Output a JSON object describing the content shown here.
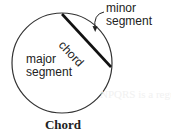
{
  "diagram": {
    "caption": "Chord",
    "labels": {
      "minor_line1": "minor",
      "minor_line2": "segment",
      "major_line1": "major",
      "major_line2": "segment",
      "chord": "chord"
    },
    "ghost_text": "NPQRS is a regular pentagon"
  },
  "colors": {
    "stroke": "#333333",
    "chord_stroke": "#111111",
    "text": "#222222",
    "background": "#ffffff"
  },
  "geometry": {
    "circle": {
      "cx": 62,
      "cy": 63,
      "r": 50
    },
    "chord": {
      "x1": 62,
      "y1": 14,
      "x2": 111,
      "y2": 67
    }
  }
}
